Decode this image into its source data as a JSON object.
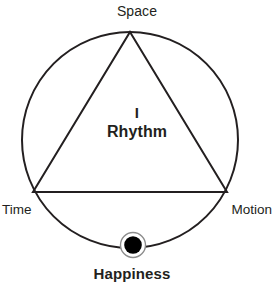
{
  "figure": {
    "title_text": "I Rhythm",
    "background_color": "#ffffff",
    "stroke_color": "#231f20",
    "marker_ring_color": "#8c8c8c",
    "marker_fill_color": "#000000"
  },
  "labels": {
    "space": "Space",
    "time": "Time",
    "motion": "Motion",
    "center_line1": "I",
    "center_line2": "Rhythm",
    "happiness": "Happiness"
  },
  "geometry": {
    "circle": {
      "cx": 130,
      "cy": 140,
      "r": 108
    },
    "triangle": {
      "apex": {
        "x": 130,
        "y": 32
      },
      "bottom_left": {
        "x": 33,
        "y": 192
      },
      "bottom_right": {
        "x": 227,
        "y": 192
      }
    },
    "marker": {
      "cx": 133,
      "cy": 245,
      "outer_r": 13,
      "inner_r": 9
    }
  }
}
